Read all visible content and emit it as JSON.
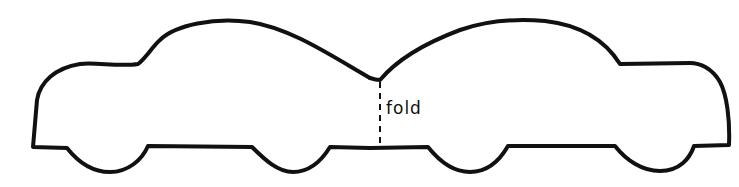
{
  "template": {
    "description": "Car cut-out template, two mirrored car silhouettes joined at a fold line",
    "fold_label": "fold",
    "colors": {
      "stroke": "#111111",
      "background": "#ffffff"
    }
  }
}
